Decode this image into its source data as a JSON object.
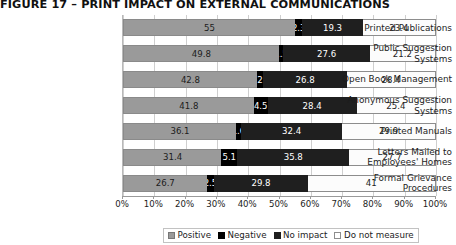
{
  "chart_data": {
    "type": "bar",
    "orientation": "horizontal",
    "stacked": true,
    "stack_mode": "percent",
    "title": "FIGURE 17 – PRINT IMPACT ON EXTERNAL COMMUNICATIONS",
    "xlabel": "",
    "ylabel": "",
    "xlim": [
      0,
      100
    ],
    "grid": true,
    "grid_axis": "x",
    "legend_position": "bottom",
    "categories": [
      "Printed Publications",
      "Public Suggestion Systems",
      "Open Book Management",
      "Anonymous Suggestion Systems",
      "Printed Manuals",
      "Letters Mailed to Employees' Homes",
      "Formal Grievance Procedures"
    ],
    "category_lines": [
      [
        "Printed Publications"
      ],
      [
        "Public Suggestion",
        "Systems"
      ],
      [
        "Open Book Management"
      ],
      [
        "Anonymous Suggestion",
        "Systems"
      ],
      [
        "Printed Manuals"
      ],
      [
        "Letters Mailed to",
        "Employees' Homes"
      ],
      [
        "Formal Grievance",
        "Procedures"
      ]
    ],
    "series": [
      {
        "name": "Positive",
        "color": "#9a9a9a",
        "values": [
          55,
          49.8,
          42.8,
          41.8,
          36.1,
          31.4,
          26.7
        ],
        "labels": [
          "55",
          "49.8",
          "42.8",
          "41.8",
          "36.1",
          "31.4",
          "26.7"
        ]
      },
      {
        "name": "Negative",
        "color": "#000000",
        "values": [
          2.3,
          1.5,
          2,
          4.5,
          1.6,
          5.1,
          2.5
        ],
        "labels": [
          "2.3",
          "1.5",
          "2",
          "4.5",
          "1.6",
          "5.1",
          "2.5"
        ]
      },
      {
        "name": "No impact",
        "color": "#1f1f1f",
        "values": [
          19.3,
          27.6,
          26.8,
          28.4,
          32.4,
          35.8,
          29.8
        ],
        "labels": [
          "19.3",
          "27.6",
          "26.8",
          "28.4",
          "32.4",
          "35.8",
          "29.8"
        ]
      },
      {
        "name": "Do not measure",
        "color": "#ffffff",
        "values": [
          23.4,
          21.2,
          28.4,
          25.4,
          29.9,
          27.7,
          41
        ],
        "labels": [
          "23.4",
          "21.2",
          "28.4",
          "25.4",
          "29.9",
          "27.7",
          "41"
        ]
      }
    ],
    "xticks": [
      0,
      10,
      20,
      30,
      40,
      50,
      60,
      70,
      80,
      90,
      100
    ],
    "xtick_labels": [
      "0%",
      "10%",
      "20%",
      "30%",
      "40%",
      "50%",
      "60%",
      "70%",
      "80%",
      "90%",
      "100%"
    ],
    "legend_entries": [
      "Positive",
      "Negative",
      "No impact",
      "Do not measure"
    ]
  }
}
